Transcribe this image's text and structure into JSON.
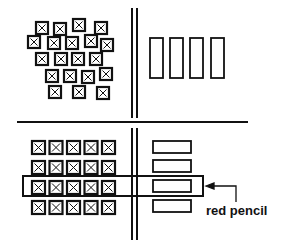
{
  "diagram": {
    "label": "red pencil",
    "colors": {
      "ink": "#111111",
      "background": "#ffffff"
    },
    "top_left": {
      "description": "scattered crossed boxes",
      "boxes": [
        [
          36,
          22
        ],
        [
          54,
          23
        ],
        [
          73,
          19
        ],
        [
          95,
          22
        ],
        [
          28,
          36
        ],
        [
          48,
          37
        ],
        [
          66,
          37
        ],
        [
          85,
          35
        ],
        [
          101,
          39
        ],
        [
          36,
          53
        ],
        [
          55,
          53
        ],
        [
          72,
          53
        ],
        [
          90,
          53
        ],
        [
          46,
          70
        ],
        [
          64,
          70
        ],
        [
          82,
          71
        ],
        [
          100,
          68
        ],
        [
          49,
          86
        ],
        [
          73,
          86
        ],
        [
          97,
          87
        ]
      ]
    },
    "top_right": {
      "description": "four tall rectangles",
      "rects": [
        [
          150,
          38
        ],
        [
          170,
          38
        ],
        [
          190,
          38
        ],
        [
          211,
          38
        ]
      ]
    },
    "bottom_left": {
      "description": "5x4 grid of crossed boxes",
      "rows": 4,
      "cols": 5
    },
    "bottom_right": {
      "description": "four wide rectangles stacked",
      "rects": [
        [
          153,
          141
        ],
        [
          153,
          160
        ],
        [
          153,
          180
        ],
        [
          153,
          200
        ]
      ]
    }
  }
}
